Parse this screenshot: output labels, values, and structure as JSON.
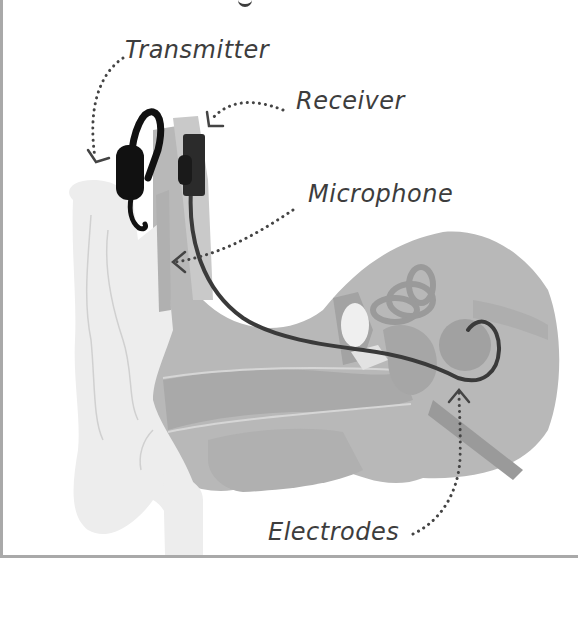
{
  "diagram": {
    "labels": {
      "transmitter": "Transmitter",
      "receiver": "Receiver",
      "microphone": "Microphone",
      "electrodes": "Electrodes"
    },
    "colors": {
      "background": "#ffffff",
      "frame_border": "#a9a9a9",
      "label_text": "#3d3d3d",
      "outer_ear": "#ededed",
      "inner_tissue": "#b5b5b5",
      "device": "#111111",
      "receiver": "#2b2b2b",
      "wire": "#3a3a3a",
      "cochlea": "#9e9e9e",
      "arrows": "#444444"
    }
  }
}
